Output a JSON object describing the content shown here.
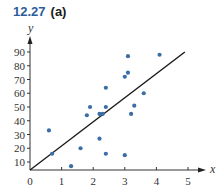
{
  "header": {
    "number": "12.27",
    "part": "(a)"
  },
  "chart_data": {
    "type": "scatter",
    "xlabel": "x",
    "ylabel": "y",
    "xlim": [
      0,
      5
    ],
    "ylim": [
      4,
      95
    ],
    "x_ticks": [
      0,
      1,
      2,
      3,
      4,
      5
    ],
    "y_ticks": [
      10,
      20,
      30,
      40,
      50,
      60,
      70,
      80,
      90
    ],
    "grid": false,
    "legend": "none",
    "point_color": "#3a6ea5",
    "points": [
      {
        "x": 0.6,
        "y": 33
      },
      {
        "x": 0.7,
        "y": 16
      },
      {
        "x": 1.3,
        "y": 7
      },
      {
        "x": 1.6,
        "y": 20
      },
      {
        "x": 1.8,
        "y": 44
      },
      {
        "x": 1.9,
        "y": 50
      },
      {
        "x": 2.2,
        "y": 27
      },
      {
        "x": 2.2,
        "y": 45
      },
      {
        "x": 2.3,
        "y": 45
      },
      {
        "x": 2.4,
        "y": 50
      },
      {
        "x": 2.4,
        "y": 64
      },
      {
        "x": 2.4,
        "y": 16
      },
      {
        "x": 3.0,
        "y": 15
      },
      {
        "x": 3.0,
        "y": 72
      },
      {
        "x": 3.1,
        "y": 75
      },
      {
        "x": 3.1,
        "y": 87
      },
      {
        "x": 3.2,
        "y": 45
      },
      {
        "x": 3.3,
        "y": 51
      },
      {
        "x": 3.6,
        "y": 60
      },
      {
        "x": 4.1,
        "y": 88
      }
    ],
    "fit_line": {
      "x": [
        0,
        4.9
      ],
      "y": [
        4,
        90
      ],
      "color": "#1a1a1a"
    }
  }
}
